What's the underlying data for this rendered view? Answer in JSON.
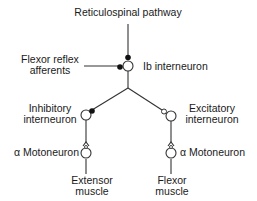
{
  "diagram": {
    "title": "Reticulospinal pathway",
    "nodes": {
      "reticulospinal": {
        "label": "Reticulospinal pathway"
      },
      "flexor_reflex_afferents": {
        "line1": "Flexor reflex",
        "line2": "afferents"
      },
      "ib_interneuron": {
        "label": "Ib interneuron"
      },
      "inhibitory_interneuron": {
        "line1": "Inhibitory",
        "line2": "interneuron"
      },
      "excitatory_interneuron": {
        "line1": "Excitatory",
        "line2": "interneuron"
      },
      "left_motoneuron": {
        "label": "α Motoneuron"
      },
      "right_motoneuron": {
        "label": "α Motoneuron"
      },
      "extensor_muscle": {
        "line1": "Extensor",
        "line2": "muscle"
      },
      "flexor_muscle": {
        "line1": "Flexor",
        "line2": "muscle"
      }
    },
    "edges": [
      {
        "from": "Reticulospinal pathway",
        "to": "Ib interneuron",
        "synapse": "inhibitory (filled)"
      },
      {
        "from": "Flexor reflex afferents",
        "to": "Ib interneuron",
        "synapse": "inhibitory (filled)"
      },
      {
        "from": "Ib interneuron",
        "to": "Inhibitory interneuron",
        "synapse": "inhibitory (filled)"
      },
      {
        "from": "Ib interneuron",
        "to": "Excitatory interneuron",
        "synapse": "excitatory (open)"
      },
      {
        "from": "Inhibitory interneuron",
        "to": "α Motoneuron (extensor)",
        "synapse": "open"
      },
      {
        "from": "Excitatory interneuron",
        "to": "α Motoneuron (flexor)",
        "synapse": "open"
      },
      {
        "from": "α Motoneuron (extensor)",
        "to": "Extensor muscle"
      },
      {
        "from": "α Motoneuron (flexor)",
        "to": "Flexor muscle"
      }
    ],
    "colors": {
      "line": "#333333",
      "text": "#1a1a1a",
      "background": "#ffffff"
    }
  }
}
